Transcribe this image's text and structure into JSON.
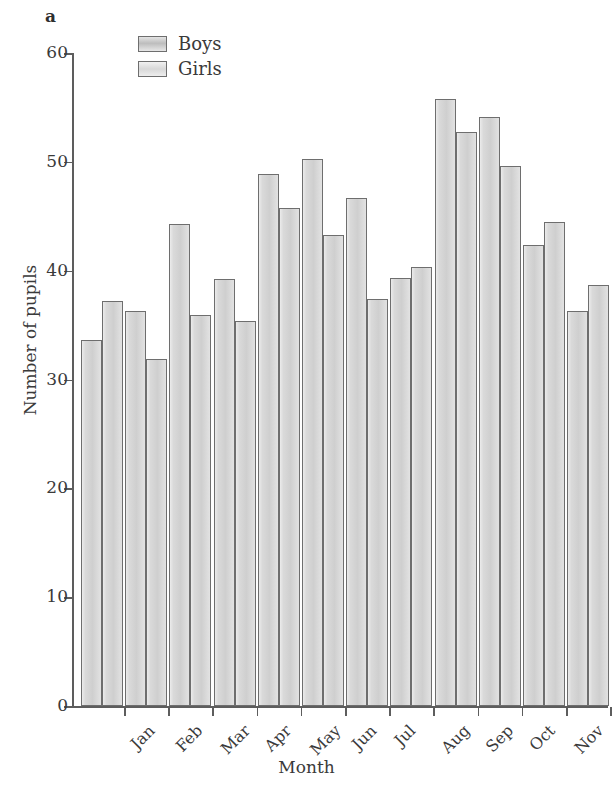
{
  "panel": {
    "label": "a"
  },
  "legend": {
    "position": "top-left-inside",
    "entries": [
      {
        "label": "Boys",
        "key": "boys",
        "color": "#c9c9c9"
      },
      {
        "label": "Girls",
        "key": "girls",
        "color": "#dcdcdc"
      }
    ]
  },
  "axes": {
    "y_title": "Number of pupils",
    "x_title": "Month",
    "y_ticks": [
      "0",
      "10",
      "20",
      "30",
      "40",
      "50",
      "60"
    ]
  },
  "style": {
    "bar_fill": "#d3d3d3",
    "bar_border": "#6e6e6e",
    "axis_color": "#5d5d5d",
    "text_color": "#3a3a3a",
    "background": "#ffffff"
  },
  "chart_data": {
    "type": "bar",
    "title": "",
    "subtitle": "",
    "panel_label": "a",
    "xlabel": "Month",
    "ylabel": "Number of pupils",
    "ylim": [
      0,
      60
    ],
    "ytick_interval": 10,
    "yticks": [
      0,
      10,
      20,
      30,
      40,
      50,
      60
    ],
    "grid": false,
    "legend": [
      "Boys",
      "Girls"
    ],
    "legend_position": "upper left (inside axes)",
    "bar_orientation": "vertical",
    "grouping": "grouped (paired, no intra-group gap)",
    "categories": [
      "Jan",
      "Feb",
      "Mar",
      "Apr",
      "May",
      "Jun",
      "Jul",
      "Aug",
      "Sep",
      "Oct",
      "Nov",
      "Dec"
    ],
    "series": [
      {
        "name": "Boys",
        "values": [
          33.6,
          36.3,
          44.3,
          39.2,
          48.9,
          50.3,
          46.7,
          39.3,
          55.8,
          54.1,
          42.4,
          36.3
        ]
      },
      {
        "name": "Girls",
        "values": [
          37.2,
          31.9,
          35.9,
          35.4,
          45.8,
          43.3,
          37.4,
          40.3,
          52.7,
          49.6,
          44.5,
          38.7
        ]
      }
    ],
    "annotations": []
  }
}
